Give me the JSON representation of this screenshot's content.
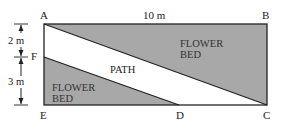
{
  "diagram": {
    "points": {
      "A": "A",
      "B": "B",
      "C": "C",
      "D": "D",
      "E": "E",
      "F": "F"
    },
    "dimensions": {
      "top": "10 m",
      "upper_left": "2 m",
      "lower_left": "3 m"
    },
    "regions": {
      "path": "PATH",
      "flower_bed_upper": [
        "FLOWER",
        "BED"
      ],
      "flower_bed_lower": [
        "FLOWER",
        "BED"
      ]
    },
    "colors": {
      "bed_fill": "#a8a8a8",
      "outline": "#222222",
      "path_fill": "#ffffff"
    }
  }
}
